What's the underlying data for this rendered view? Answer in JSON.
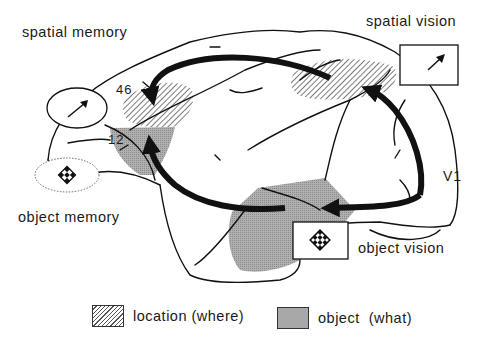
{
  "labels": {
    "spatial_memory": "spatial memory",
    "spatial_vision": "spatial vision",
    "object_memory": "object memory",
    "object_vision": "object vision",
    "v1": "V1",
    "area_46": "46",
    "area_12": "12"
  },
  "legend": [
    {
      "label": "location (where)",
      "pattern": "hatched"
    },
    {
      "label": "object  (what)",
      "pattern": "grey-stipple"
    }
  ],
  "icons": {
    "spatial_icon": "arrow-up-right-icon",
    "object_icon": "checkered-diamond-icon"
  },
  "colors": {
    "ink": "#111111",
    "object_fill": "#a8a8a8",
    "hatch": "#555555",
    "background": "#ffffff"
  }
}
